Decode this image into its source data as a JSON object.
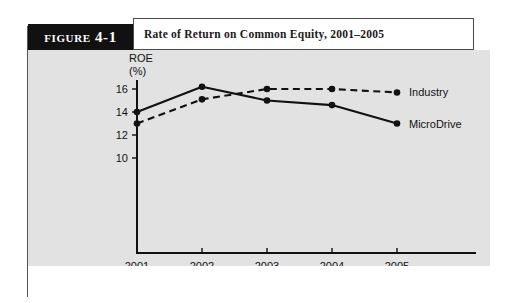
{
  "figure": {
    "tab_label": "Figure 4-1",
    "title": "Rate of Return on Common Equity, 2001–2005"
  },
  "chart_data": {
    "type": "line",
    "title": "Rate of Return on Common Equity, 2001–2005",
    "xlabel": "",
    "ylabel": "ROE (%)",
    "ylabel_line1": "ROE",
    "ylabel_line2": "(%)",
    "categories": [
      "2001",
      "2002",
      "2003",
      "2004",
      "2005"
    ],
    "x": [
      2001,
      2002,
      2003,
      2004,
      2005
    ],
    "xlim": [
      2001,
      2005
    ],
    "ylim": [
      9.0,
      17.0
    ],
    "yticks": [
      10,
      12,
      14,
      16
    ],
    "ytick_labels": [
      "10",
      "12",
      "14",
      "16"
    ],
    "xtick_labels": [
      "2001",
      "2002",
      "2003",
      "2004",
      "2005"
    ],
    "grid": false,
    "legend_position": "right-inline",
    "series": [
      {
        "name": "Industry",
        "style": "dashed",
        "values": [
          13.0,
          15.1,
          16.0,
          16.0,
          15.7
        ]
      },
      {
        "name": "MicroDrive",
        "style": "solid",
        "values": [
          14.0,
          16.2,
          15.0,
          14.6,
          13.0
        ]
      }
    ]
  }
}
